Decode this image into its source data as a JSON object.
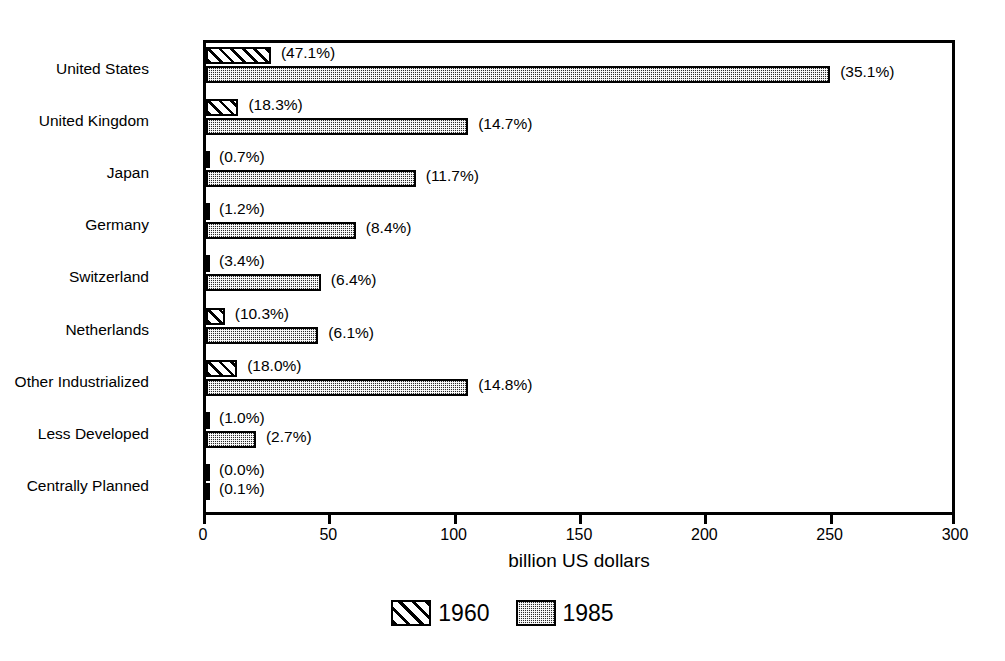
{
  "chart_data": {
    "type": "bar",
    "orientation": "horizontal",
    "title": "",
    "xlabel": "billion US dollars",
    "ylabel": "",
    "xlim": [
      0,
      300
    ],
    "xticks": [
      0,
      50,
      100,
      150,
      200,
      250,
      300
    ],
    "xtick_labels": [
      "0",
      "50",
      "100",
      "150",
      "200",
      "250",
      "300"
    ],
    "grid": false,
    "legend_position": "bottom",
    "categories": [
      "United States",
      "United Kingdom",
      "Japan",
      "Germany",
      "Switzerland",
      "Netherlands",
      "Other Industrialized",
      "Less Developed",
      "Centrally Planned"
    ],
    "series": [
      {
        "name": "1960",
        "values": [
          26.0,
          13.0,
          0.5,
          0.8,
          1.2,
          7.5,
          12.5,
          0.7,
          0.0
        ],
        "labels": [
          "(47.1%)",
          "(18.3%)",
          "(0.7%)",
          "(1.2%)",
          "(3.4%)",
          "(10.3%)",
          "(18.0%)",
          "(1.0%)",
          "(0.0%)"
        ],
        "share_percent": [
          47.1,
          18.3,
          0.7,
          1.2,
          3.4,
          10.3,
          18.0,
          1.0,
          0.0
        ]
      },
      {
        "name": "1985",
        "values": [
          250.0,
          105.0,
          84.0,
          60.0,
          46.0,
          45.0,
          105.0,
          20.0,
          0.7
        ],
        "labels": [
          "(35.1%)",
          "(14.7%)",
          "(11.7%)",
          "(8.4%)",
          "(6.4%)",
          "(6.1%)",
          "(14.8%)",
          "(2.7%)",
          "(0.1%)"
        ],
        "share_percent": [
          35.1,
          14.7,
          11.7,
          8.4,
          6.4,
          6.1,
          14.8,
          2.7,
          0.1
        ]
      }
    ]
  },
  "legend": {
    "items": [
      {
        "label": "1960",
        "pattern": "diagonal-hatch"
      },
      {
        "label": "1985",
        "pattern": "dotted-fill"
      }
    ]
  }
}
